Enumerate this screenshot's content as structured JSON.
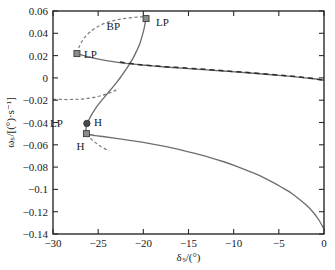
{
  "chart_data": {
    "type": "line",
    "title": "",
    "xlabel": "δₛ/(°)",
    "ylabel": "ωₛ/[(°)·s⁻¹]",
    "xlim": [
      -30,
      0
    ],
    "ylim": [
      -0.14,
      0.06
    ],
    "xticks": [
      -30,
      -25,
      -20,
      -15,
      -10,
      -5,
      0
    ],
    "xtick_labels": [
      "−30",
      "−25",
      "−20",
      "−15",
      "−10",
      "−5",
      "0"
    ],
    "yticks": [
      0.06,
      0.04,
      0.02,
      0,
      -0.02,
      -0.04,
      -0.06,
      -0.08,
      -0.1,
      -0.12,
      -0.14
    ],
    "ytick_labels": [
      "0.06",
      "0.04",
      "0.02",
      "0",
      "−0.02",
      "−0.04",
      "−0.06",
      "−0.08",
      "−0.1",
      "−0.12",
      "−0.14"
    ],
    "grid": false,
    "legend": null,
    "series": [
      {
        "name": "equilibrium-branch-solid",
        "style": "solid",
        "color": "#6e6e6e",
        "points": [
          [
            0.0,
            -0.1355
          ],
          [
            -0.6,
            -0.127
          ],
          [
            -1.2,
            -0.1205
          ],
          [
            -1.9,
            -0.1145
          ],
          [
            -2.7,
            -0.109
          ],
          [
            -3.6,
            -0.1035
          ],
          [
            -4.6,
            -0.0985
          ],
          [
            -5.7,
            -0.0935
          ],
          [
            -6.9,
            -0.0885
          ],
          [
            -8.2,
            -0.084
          ],
          [
            -9.6,
            -0.0795
          ],
          [
            -11.1,
            -0.0752
          ],
          [
            -12.7,
            -0.0712
          ],
          [
            -14.4,
            -0.0675
          ],
          [
            -16.1,
            -0.0641
          ],
          [
            -17.9,
            -0.061
          ],
          [
            -19.7,
            -0.0583
          ],
          [
            -21.5,
            -0.056
          ],
          [
            -23.0,
            -0.0542
          ],
          [
            -24.3,
            -0.0528
          ],
          [
            -25.3,
            -0.0518
          ],
          [
            -25.9,
            -0.051
          ],
          [
            -26.25,
            -0.0498
          ]
        ]
      },
      {
        "name": "middle-branch-solid",
        "style": "solid",
        "color": "#6e6e6e",
        "points": [
          [
            -26.25,
            -0.0498
          ],
          [
            -26.35,
            -0.047
          ],
          [
            -26.32,
            -0.044
          ],
          [
            -26.2,
            -0.041
          ],
          [
            -26.05,
            -0.038
          ],
          [
            -25.8,
            -0.034
          ],
          [
            -25.5,
            -0.03
          ],
          [
            -25.15,
            -0.0258
          ],
          [
            -24.75,
            -0.0215
          ],
          [
            -24.3,
            -0.0172
          ],
          [
            -23.85,
            -0.0128
          ],
          [
            -23.4,
            -0.0085
          ],
          [
            -22.95,
            -0.004
          ],
          [
            -22.5,
            0.0008
          ],
          [
            -22.05,
            0.006
          ],
          [
            -21.6,
            0.0115
          ],
          [
            -21.15,
            0.0175
          ],
          [
            -20.75,
            0.024
          ],
          [
            -20.4,
            0.0305
          ],
          [
            -20.15,
            0.037
          ],
          [
            -19.95,
            0.043
          ],
          [
            -19.82,
            0.048
          ],
          [
            -19.74,
            0.052
          ],
          [
            -19.7,
            0.0545
          ]
        ]
      },
      {
        "name": "upper-branch-solid",
        "style": "solid",
        "color": "#6e6e6e",
        "points": [
          [
            -27.35,
            0.0218
          ],
          [
            -26.6,
            0.02
          ],
          [
            -25.6,
            0.018
          ],
          [
            -24.4,
            0.016
          ],
          [
            -23.0,
            0.0142
          ],
          [
            -21.4,
            0.0126
          ],
          [
            -19.6,
            0.0112
          ],
          [
            -17.6,
            0.0098
          ],
          [
            -15.4,
            0.0085
          ],
          [
            -13.0,
            0.0072
          ],
          [
            -10.6,
            0.0058
          ],
          [
            -8.2,
            0.0044
          ],
          [
            -5.8,
            0.0028
          ],
          [
            -3.4,
            0.0012
          ],
          [
            -1.4,
            -0.0005
          ],
          [
            0.0,
            -0.002
          ]
        ]
      },
      {
        "name": "upper-branch-dashed-overlay",
        "style": "dashed",
        "color": "#2b2b2b",
        "points": [
          [
            -22.6,
            0.0143
          ],
          [
            -20.6,
            0.012
          ],
          [
            -18.2,
            0.0104
          ],
          [
            -15.6,
            0.009
          ],
          [
            -13.0,
            0.0076
          ],
          [
            -10.4,
            0.006
          ],
          [
            -7.8,
            0.0044
          ],
          [
            -5.2,
            0.0026
          ],
          [
            -2.6,
            0.0008
          ],
          [
            0.0,
            -0.002
          ]
        ]
      },
      {
        "name": "upper-loop-dashed",
        "style": "dashed",
        "color": "#7a7a7a",
        "points": [
          [
            -27.35,
            0.022
          ],
          [
            -27.15,
            0.027
          ],
          [
            -26.85,
            0.032
          ],
          [
            -26.45,
            0.0368
          ],
          [
            -25.9,
            0.0412
          ],
          [
            -25.25,
            0.045
          ],
          [
            -24.5,
            0.0482
          ],
          [
            -23.65,
            0.0506
          ],
          [
            -22.75,
            0.0524
          ],
          [
            -21.8,
            0.0536
          ],
          [
            -20.9,
            0.0544
          ],
          [
            -20.25,
            0.0548
          ],
          [
            -19.8,
            0.055
          ]
        ]
      },
      {
        "name": "lower-dashed-branch",
        "style": "dashed",
        "color": "#7a7a7a",
        "points": [
          [
            -30.0,
            -0.0192
          ],
          [
            -29.2,
            -0.0193
          ],
          [
            -28.4,
            -0.0194
          ],
          [
            -27.6,
            -0.0193
          ],
          [
            -26.9,
            -0.019
          ],
          [
            -26.2,
            -0.0184
          ],
          [
            -25.5,
            -0.0175
          ],
          [
            -24.8,
            -0.0162
          ],
          [
            -24.2,
            -0.0148
          ],
          [
            -23.6,
            -0.013
          ],
          [
            -23.1,
            -0.0112
          ],
          [
            -22.7,
            -0.0095
          ]
        ]
      },
      {
        "name": "lower-dashed-tail",
        "style": "dashed",
        "color": "#7a7a7a",
        "points": [
          [
            -26.3,
            -0.0505
          ],
          [
            -25.6,
            -0.056
          ],
          [
            -24.8,
            -0.061
          ],
          [
            -23.8,
            -0.0655
          ]
        ]
      }
    ],
    "annotations": [
      {
        "name": "lp-upper-right",
        "label": "LP",
        "marker": "square-filled",
        "x": -19.7,
        "y": 0.0532,
        "label_dx": 10,
        "label_dy": 7
      },
      {
        "name": "bp-upper",
        "label": "BP",
        "marker": "none",
        "x": -19.7,
        "y": 0.0532,
        "label_dx": -26,
        "label_dy": 11
      },
      {
        "name": "lp-left",
        "label": "LP",
        "marker": "square-filled",
        "x": -27.35,
        "y": 0.0218,
        "label_dx": 7,
        "label_dy": 4
      },
      {
        "name": "lp-lower",
        "label": "LP",
        "marker": "none",
        "x": -26.25,
        "y": -0.0408,
        "label_dx": -24,
        "label_dy": 4
      },
      {
        "name": "h-upper",
        "label": "H",
        "marker": "circle-filled",
        "x": -26.25,
        "y": -0.0408,
        "label_dx": 7,
        "label_dy": 3
      },
      {
        "name": "h-lower",
        "label": "H",
        "marker": "square-filled",
        "x": -26.3,
        "y": -0.05,
        "label_dx": -2,
        "label_dy": 16
      }
    ]
  }
}
